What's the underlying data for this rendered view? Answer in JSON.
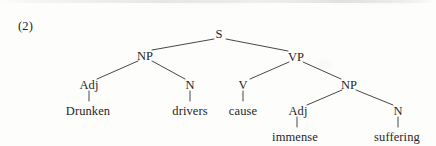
{
  "page": {
    "example_number": "(2)",
    "background_color": "#fdfdfc",
    "ink_color": "#262626"
  },
  "tree": {
    "type": "constituency-syntax-tree",
    "sentence": "Drunken drivers cause immense suffering",
    "nodes": [
      {
        "id": "s",
        "label": "S",
        "kind": "category",
        "x": 219,
        "y": 34
      },
      {
        "id": "np1",
        "label": "NP",
        "kind": "category",
        "x": 145,
        "y": 56
      },
      {
        "id": "vp",
        "label": "VP",
        "kind": "category",
        "x": 296,
        "y": 57
      },
      {
        "id": "adj1",
        "label": "Adj",
        "kind": "category",
        "x": 89,
        "y": 85
      },
      {
        "id": "n1",
        "label": "N",
        "kind": "category",
        "x": 190,
        "y": 85
      },
      {
        "id": "v",
        "label": "V",
        "kind": "category",
        "x": 243,
        "y": 85
      },
      {
        "id": "np2",
        "label": "NP",
        "kind": "category",
        "x": 349,
        "y": 85
      },
      {
        "id": "drunken",
        "label": "Drunken",
        "kind": "word",
        "x": 88,
        "y": 111
      },
      {
        "id": "drivers",
        "label": "drivers",
        "kind": "word",
        "x": 190,
        "y": 111
      },
      {
        "id": "cause",
        "label": "cause",
        "kind": "word",
        "x": 243,
        "y": 111
      },
      {
        "id": "adj2",
        "label": "Adj",
        "kind": "category",
        "x": 298,
        "y": 111
      },
      {
        "id": "n2",
        "label": "N",
        "kind": "category",
        "x": 398,
        "y": 111
      },
      {
        "id": "immense",
        "label": "immense",
        "kind": "word",
        "x": 295,
        "y": 137
      },
      {
        "id": "suffering",
        "label": "suffering",
        "kind": "word",
        "x": 397,
        "y": 137
      }
    ],
    "edges": [
      {
        "from": "s",
        "to": "np1",
        "x1": 214,
        "y1": 39,
        "x2": 152,
        "y2": 50
      },
      {
        "from": "s",
        "to": "vp",
        "x1": 226,
        "y1": 39,
        "x2": 288,
        "y2": 51
      },
      {
        "from": "np1",
        "to": "adj1",
        "x1": 138,
        "y1": 61,
        "x2": 97,
        "y2": 79
      },
      {
        "from": "np1",
        "to": "n1",
        "x1": 152,
        "y1": 61,
        "x2": 185,
        "y2": 79
      },
      {
        "from": "vp",
        "to": "v",
        "x1": 289,
        "y1": 62,
        "x2": 250,
        "y2": 79
      },
      {
        "from": "vp",
        "to": "np2",
        "x1": 303,
        "y1": 62,
        "x2": 341,
        "y2": 79
      },
      {
        "from": "np2",
        "to": "adj2",
        "x1": 342,
        "y1": 90,
        "x2": 307,
        "y2": 105
      },
      {
        "from": "np2",
        "to": "n2",
        "x1": 356,
        "y1": 90,
        "x2": 393,
        "y2": 105
      },
      {
        "from": "adj1",
        "to": "drunken",
        "x1": 89,
        "y1": 91,
        "x2": 89,
        "y2": 101
      },
      {
        "from": "n1",
        "to": "drivers",
        "x1": 190,
        "y1": 91,
        "x2": 190,
        "y2": 101
      },
      {
        "from": "v",
        "to": "cause",
        "x1": 243,
        "y1": 91,
        "x2": 243,
        "y2": 101
      },
      {
        "from": "adj2",
        "to": "immense",
        "x1": 297,
        "y1": 117,
        "x2": 297,
        "y2": 127
      },
      {
        "from": "n2",
        "to": "suffering",
        "x1": 398,
        "y1": 117,
        "x2": 398,
        "y2": 127
      }
    ]
  }
}
